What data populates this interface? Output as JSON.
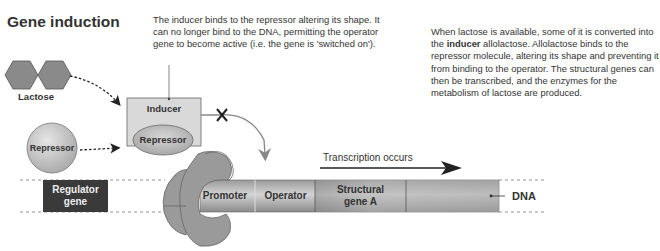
{
  "title": "Gene induction",
  "annotations": {
    "inducer_note": "The inducer binds to the repressor altering its shape. It can no longer bind to the DNA, permitting the operator gene to become active (i.e. the gene is 'switched on').",
    "explanation_before_bold": "When lactose is available, some of it is converted into the ",
    "explanation_bold": "inducer",
    "explanation_after_bold": " allolactose. Allolactose binds to the repressor molecule, altering its shape and preventing it from binding to the operator. The structural genes can then be transcribed, and the enzymes for the metabolism of lactose are produced."
  },
  "molecules": {
    "lactose": "Lactose",
    "free_repressor": "Repressor",
    "complex_inducer": "Inducer",
    "complex_repressor": "Repressor"
  },
  "dna": {
    "regulator_gene_line1": "Regulator",
    "regulator_gene_line2": "gene",
    "promoter": "Promoter",
    "operator": "Operator",
    "structural_gene_line1": "Structural",
    "structural_gene_line2": "gene A",
    "dna_label": "DNA"
  },
  "arrows": {
    "transcription": "Transcription occurs",
    "blocked_binding_marker": "×"
  },
  "colors": {
    "hexagon_fill": "#8a8a8a",
    "regulator_fill": "#3a3a3a",
    "dna_fill": "#a8a8a8",
    "complex_box": "#d9d9d9",
    "polymerase": "#9a9a9a"
  }
}
